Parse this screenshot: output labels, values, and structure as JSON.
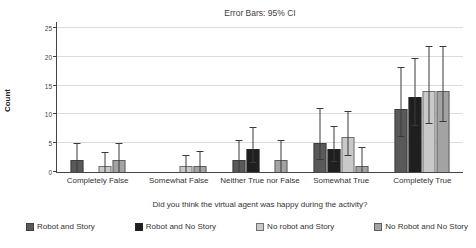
{
  "title": "Error Bars: 95% CI",
  "y_axis": {
    "label": "Count",
    "ticks": [
      0,
      5,
      10,
      15,
      20,
      25
    ],
    "max": 25
  },
  "x_axis": {
    "label": "Did you think the virtual agent was happy during the activity?"
  },
  "legend": [
    {
      "name": "Robot and Story",
      "color": "#595959"
    },
    {
      "name": "Robot and No Story",
      "color": "#1f1f1f"
    },
    {
      "name": "No robot and Story",
      "color": "#c9c9c9"
    },
    {
      "name": "No Robot and No Story",
      "color": "#a3a3a3"
    }
  ],
  "chart_data": {
    "type": "bar",
    "title": "Error Bars: 95% CI",
    "xlabel": "Did you think the virtual agent was happy during the activity?",
    "ylabel": "Count",
    "ylim": [
      0,
      25
    ],
    "grid": true,
    "legend_position": "bottom",
    "error_bars": "95% CI",
    "categories": [
      "Completely False",
      "Somewhat False",
      "Neither True nor False",
      "Somewhat True",
      "Completely True"
    ],
    "series": [
      {
        "name": "Robot and Story",
        "color": "#595959",
        "values": [
          2,
          0,
          2,
          5,
          11
        ],
        "ci": [
          [
            0,
            4.8
          ],
          null,
          [
            0,
            5.3
          ],
          [
            2,
            11
          ],
          [
            6,
            18
          ]
        ]
      },
      {
        "name": "Robot and No Story",
        "color": "#1f1f1f",
        "values": [
          0,
          0,
          4,
          4,
          13
        ],
        "ci": [
          null,
          null,
          [
            1.5,
            7.6
          ],
          [
            1.8,
            7.9
          ],
          [
            8,
            19.7
          ]
        ]
      },
      {
        "name": "No robot and Story",
        "color": "#c9c9c9",
        "values": [
          1,
          1,
          0,
          6,
          14
        ],
        "ci": [
          [
            0,
            3.3
          ],
          [
            0,
            2.8
          ],
          null,
          [
            2.7,
            10.5
          ],
          [
            8.3,
            21.7
          ]
        ]
      },
      {
        "name": "No Robot and No Story",
        "color": "#a3a3a3",
        "values": [
          2,
          1,
          2,
          1,
          14
        ],
        "ci": [
          [
            0,
            4.8
          ],
          [
            0,
            3.4
          ],
          [
            0,
            5.3
          ],
          [
            0,
            4.2
          ],
          [
            8.7,
            21.7
          ]
        ]
      }
    ]
  }
}
